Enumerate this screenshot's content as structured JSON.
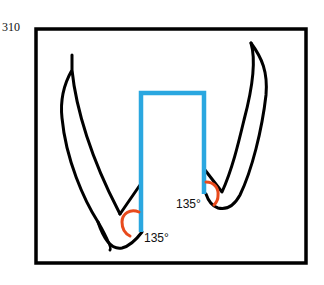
{
  "figure": {
    "number": "310",
    "colors": {
      "frame": "#000000",
      "teeth_outline": "#000000",
      "preparation": "#2aa7e0",
      "angle_arc": "#e84a1c"
    },
    "angles": [
      {
        "label": "135°",
        "side": "left"
      },
      {
        "label": "135°",
        "side": "right"
      }
    ]
  }
}
